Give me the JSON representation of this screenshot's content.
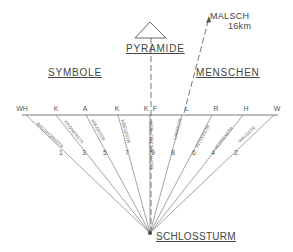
{
  "labels": {
    "pyramid": "PYRAMIDE",
    "symbols": "SYMBOLE",
    "people": "MENSCHEN",
    "malsch": "MALSCH",
    "malsch_distance": "16km",
    "castle_tower": "SCHLOSSTURM"
  },
  "streets": [
    {
      "abbr": "WH",
      "name": "WALDHORNSTR",
      "number": "1"
    },
    {
      "abbr": "K",
      "name": "KRONENSTR",
      "number": "3"
    },
    {
      "abbr": "A",
      "name": "ADLERSTR",
      "number": "5"
    },
    {
      "abbr": "K",
      "name": "KREUZSTR",
      "number": "7"
    },
    {
      "abbr": "K",
      "name": "KARL-FRIEDRICH-STR",
      "number": "9"
    },
    {
      "abbr": "F",
      "name": "",
      "number": ""
    },
    {
      "abbr": "L",
      "name": "LAMMSTR",
      "number": "8"
    },
    {
      "abbr": "R",
      "name": "RITTERSTR",
      "number": "6"
    },
    {
      "abbr": "H",
      "name": "HERRENSTR",
      "number": "4"
    },
    {
      "abbr": "W",
      "name": "WALDSTR",
      "number": "2"
    }
  ]
}
